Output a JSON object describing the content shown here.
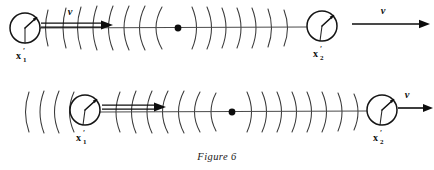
{
  "figure": {
    "caption": "Figure 6",
    "background_color": "#ffffff",
    "ink_color": "#111111",
    "wave_color": "#3a3a3a"
  },
  "rows": [
    {
      "id": "top-row",
      "description": "Source moving to the right with observer bodies at each end",
      "axis_y": 28,
      "left_body": {
        "label_base": "x",
        "label_subscript": "1",
        "label_prime": "′",
        "cx": 25,
        "cy": 28,
        "r": 15,
        "hand_angle_deg": 50
      },
      "right_body": {
        "label_base": "x",
        "label_subscript": "2",
        "label_prime": "′",
        "cx": 322,
        "cy": 26,
        "r": 15,
        "hand_angle_deg": 55
      },
      "source_dot": {
        "cx": 178,
        "cy": 28,
        "r": 3.4
      },
      "left_velocity": {
        "label": "v",
        "label_x": 70,
        "label_y": 15
      },
      "right_velocity": {
        "label": "v",
        "label_x": 383,
        "label_y": 14
      },
      "arc_count_left": 8,
      "arc_count_right": 7
    },
    {
      "id": "bottom-row",
      "description": "Same configuration shifted; source dot at mid-axis",
      "axis_y": 112,
      "left_body": {
        "label_base": "x",
        "label_subscript": "1",
        "label_prime": "′",
        "cx": 85,
        "cy": 110,
        "r": 15,
        "hand_angle_deg": 50
      },
      "right_body": {
        "label_base": "x",
        "label_subscript": "2",
        "label_prime": "′",
        "cx": 382,
        "cy": 110,
        "r": 15,
        "hand_angle_deg": 55
      },
      "source_dot": {
        "cx": 232,
        "cy": 112,
        "r": 3.4
      },
      "right_velocity": {
        "label": "v",
        "label_x": 407,
        "label_y": 98
      },
      "arc_count_left": 9,
      "arc_count_right": 8
    }
  ]
}
